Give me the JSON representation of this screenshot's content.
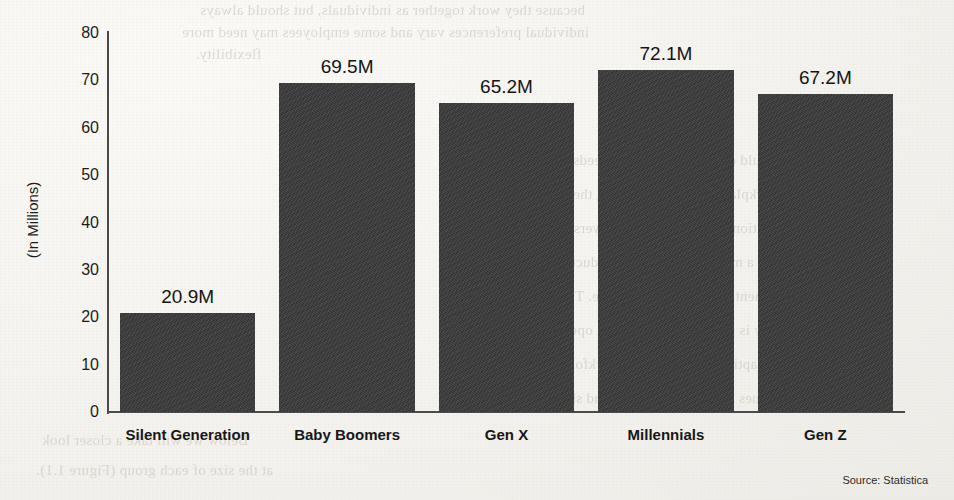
{
  "chart_data": {
    "type": "bar",
    "title": "",
    "xlabel": "",
    "ylabel": "(In Millions)",
    "categories": [
      "Silent Generation",
      "Baby Boomers",
      "Gen X",
      "Millennials",
      "Gen Z"
    ],
    "values": [
      20.9,
      69.5,
      65.2,
      72.1,
      67.2
    ],
    "value_labels": [
      "20.9M",
      "69.5M",
      "65.2M",
      "72.1M",
      "67.2M"
    ],
    "ylim": [
      0,
      80
    ],
    "yticks": [
      80,
      70,
      60,
      50,
      40,
      30,
      20,
      10,
      0
    ],
    "grid": false,
    "legend": "none",
    "bar_color": "#3b3b3b",
    "axis_color": "#4a4a4a"
  },
  "footer": {
    "source": "Source: Statistica"
  },
  "page_background": {
    "paper_color": "#f6f5f2",
    "bleed_through_lines": [
      "because they work together as individuals, but should always",
      "individual preferences vary and some employees may need more",
      "flexibility.",
      "should consider the unique needs of",
      "workplace. By understanding these",
      "generational differences, employers can",
      "create a more inclusive and productive",
      "environment that benefits everyone. The",
      "key is to remain flexible and open to",
      "adapting policies as the workforce",
      "continues to evolve over time and shift.",
      "Below we will take a closer look",
      "at the size of each group (Figure 1.1)."
    ]
  }
}
